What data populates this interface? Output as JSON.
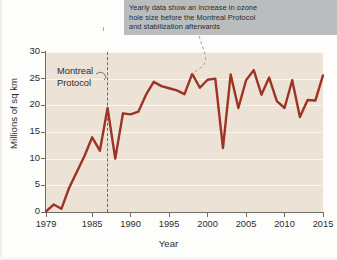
{
  "annotation": {
    "lines": [
      "Yearly data show an increase in ozone",
      "hole size before the Montreal Protocol",
      "and stabilization afterwards"
    ]
  },
  "marker": {
    "label_line1": "Montreal",
    "label_line2": "Protocol",
    "year": 1987
  },
  "colors": {
    "line": "#9c3324",
    "plot_background": "#ece2d5",
    "gridline": "#faf6f0",
    "axis": "#6d6e68",
    "callout_background": "#b9bdbd",
    "text": "#2c2d2e"
  },
  "chart_data": {
    "type": "line",
    "title": "",
    "xlabel": "Year",
    "ylabel": "Millions of sq km",
    "xlim": [
      1979,
      2015
    ],
    "ylim": [
      0,
      30
    ],
    "xticks": [
      1979,
      1985,
      1990,
      1995,
      2000,
      2005,
      2010,
      2015
    ],
    "xtick_labels": [
      "1979",
      "1985",
      "1990",
      "1995",
      "2000",
      "2005",
      "2010",
      "2015"
    ],
    "yticks": [
      0,
      5,
      10,
      15,
      20,
      25,
      30
    ],
    "ytick_labels": [
      "0",
      "5",
      "10",
      "15",
      "20",
      "25",
      "30"
    ],
    "grid": "horizontal",
    "legend": "none",
    "x": [
      1979,
      1980,
      1981,
      1982,
      1983,
      1984,
      1985,
      1986,
      1987,
      1988,
      1989,
      1990,
      1991,
      1992,
      1993,
      1994,
      1995,
      1996,
      1997,
      1998,
      1999,
      2000,
      2001,
      2002,
      2003,
      2004,
      2005,
      2006,
      2007,
      2008,
      2009,
      2010,
      2011,
      2012,
      2013,
      2014,
      2015
    ],
    "values": [
      0.1,
      1.4,
      0.6,
      4.5,
      7.5,
      10.5,
      14.0,
      11.5,
      19.5,
      10.0,
      18.5,
      18.3,
      18.8,
      22.0,
      24.4,
      23.6,
      23.2,
      22.8,
      22.1,
      25.9,
      23.3,
      24.8,
      25.0,
      12.0,
      25.8,
      19.5,
      24.7,
      26.6,
      22.0,
      25.2,
      20.8,
      19.5,
      24.7,
      17.8,
      21.0,
      20.9,
      25.6
    ]
  }
}
